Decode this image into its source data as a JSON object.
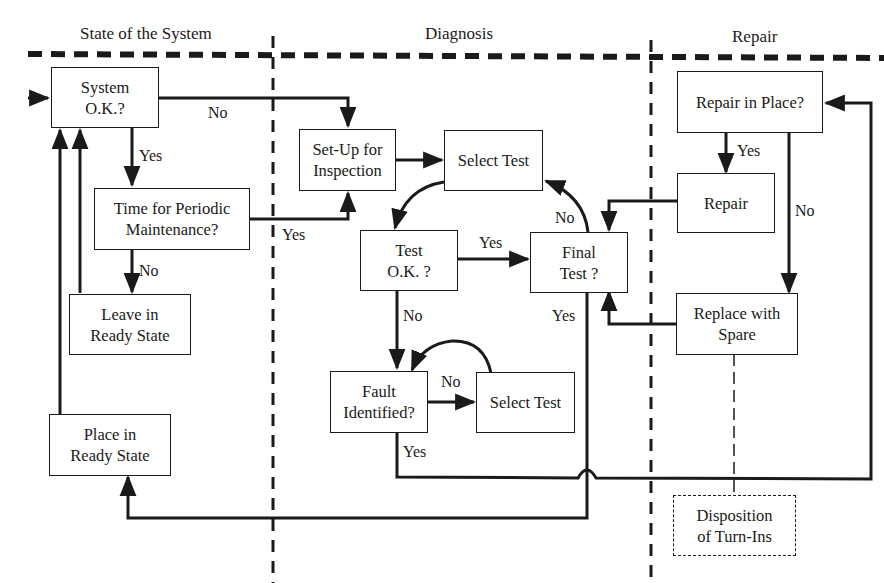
{
  "lanes": [
    {
      "title": "State of the System"
    },
    {
      "title": "Diagnosis"
    },
    {
      "title": "Repair"
    }
  ],
  "nodes": {
    "system_ok": {
      "line1": "System",
      "line2": "O.K.?"
    },
    "periodic": {
      "line1": "Time for Periodic",
      "line2": "Maintenance?"
    },
    "leave_ready": {
      "line1": "Leave in",
      "line2": "Ready State"
    },
    "place_ready": {
      "line1": "Place in",
      "line2": "Ready State"
    },
    "setup": {
      "line1": "Set-Up for",
      "line2": "Inspection"
    },
    "select_test_1": {
      "line1": "Select Test"
    },
    "test_ok": {
      "line1": "Test",
      "line2": "O.K. ?"
    },
    "final_test": {
      "line1": "Final",
      "line2": "Test ?"
    },
    "fault": {
      "line1": "Fault",
      "line2": "Identified?"
    },
    "select_test_2": {
      "line1": "Select Test"
    },
    "repair_in_place": {
      "line1": "Repair in Place?"
    },
    "repair": {
      "line1": "Repair"
    },
    "replace": {
      "line1": "Replace with",
      "line2": "Spare"
    },
    "disposition": {
      "line1": "Disposition",
      "line2": "of Turn-Ins"
    }
  },
  "edge_labels": {
    "system_no": "No",
    "system_yes": "Yes",
    "periodic_yes": "Yes",
    "periodic_no": "No",
    "test_yes": "Yes",
    "test_no": "No",
    "final_no": "No",
    "final_yes": "Yes",
    "fault_no": "No",
    "fault_yes": "Yes",
    "repair_yes": "Yes",
    "repair_no": "No"
  }
}
